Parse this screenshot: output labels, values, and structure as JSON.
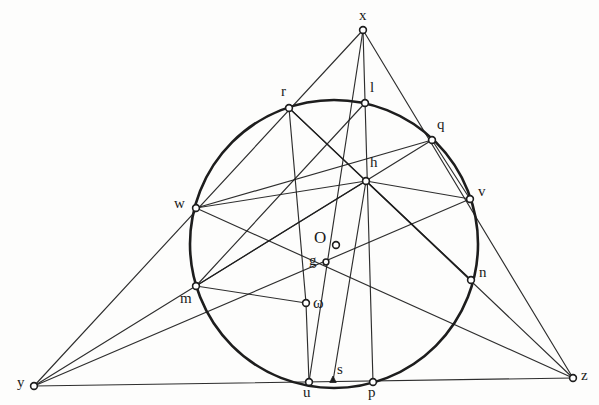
{
  "figure": {
    "background_color": "#fdfdfc",
    "ink_color": "#1d1d1d",
    "circle": {
      "name": "main-circle",
      "center_label": "O",
      "cx": 334,
      "cy": 244,
      "r": 144,
      "stroke_width": 2.6
    },
    "points": [
      {
        "id": "x",
        "label": "x",
        "cx": 363,
        "cy": 30,
        "lx": 359,
        "ly": 8,
        "marker": "ring",
        "size": "normal"
      },
      {
        "id": "y",
        "label": "y",
        "cx": 34,
        "cy": 386,
        "lx": 17,
        "ly": 375,
        "marker": "ring",
        "size": "normal"
      },
      {
        "id": "z",
        "label": "z",
        "cx": 573,
        "cy": 378,
        "lx": 581,
        "ly": 368,
        "marker": "ring",
        "size": "normal"
      },
      {
        "id": "r",
        "label": "r",
        "cx": 289,
        "cy": 108,
        "lx": 281,
        "ly": 84,
        "marker": "ring",
        "size": "normal"
      },
      {
        "id": "l",
        "label": "l",
        "cx": 365,
        "cy": 103,
        "lx": 370,
        "ly": 80,
        "marker": "ring",
        "size": "normal"
      },
      {
        "id": "q",
        "label": "q",
        "cx": 432,
        "cy": 140,
        "lx": 437,
        "ly": 117,
        "marker": "ring",
        "size": "normal"
      },
      {
        "id": "v",
        "label": "v",
        "cx": 470,
        "cy": 199,
        "lx": 478,
        "ly": 184,
        "marker": "ring",
        "size": "normal"
      },
      {
        "id": "n",
        "label": "n",
        "cx": 471,
        "cy": 280,
        "lx": 479,
        "ly": 265,
        "marker": "ring",
        "size": "normal"
      },
      {
        "id": "w",
        "label": "w",
        "cx": 196,
        "cy": 208,
        "lx": 174,
        "ly": 196,
        "marker": "ring",
        "size": "normal"
      },
      {
        "id": "m",
        "label": "m",
        "cx": 196,
        "cy": 286,
        "lx": 180,
        "ly": 291,
        "marker": "ring",
        "size": "normal"
      },
      {
        "id": "h",
        "label": "h",
        "cx": 366,
        "cy": 181,
        "lx": 370,
        "ly": 155,
        "marker": "ring",
        "size": "normal"
      },
      {
        "id": "O",
        "label": "O",
        "cx": 336,
        "cy": 245,
        "lx": 314,
        "ly": 229,
        "marker": "ring",
        "size": "big"
      },
      {
        "id": "g",
        "label": "g",
        "cx": 326,
        "cy": 262,
        "lx": 309,
        "ly": 253,
        "marker": "dot",
        "size": "normal"
      },
      {
        "id": "omega",
        "label": "ω",
        "cx": 306,
        "cy": 303,
        "lx": 313,
        "ly": 295,
        "marker": "ring",
        "size": "omega"
      },
      {
        "id": "u",
        "label": "u",
        "cx": 309,
        "cy": 382,
        "lx": 303,
        "ly": 385,
        "marker": "ring",
        "size": "normal"
      },
      {
        "id": "s",
        "label": "s",
        "cx": 333,
        "cy": 381,
        "lx": 337,
        "ly": 362,
        "marker": "tick",
        "size": "normal"
      },
      {
        "id": "p",
        "label": "p",
        "cx": 373,
        "cy": 382,
        "lx": 368,
        "ly": 385,
        "marker": "ring",
        "size": "normal"
      }
    ],
    "segments": [
      {
        "name": "side-xy",
        "from": "x",
        "to": "y",
        "weight": "thin"
      },
      {
        "name": "side-xz",
        "from": "x",
        "to": "z",
        "weight": "thin"
      },
      {
        "name": "side-yz",
        "from": "y",
        "to": "z",
        "weight": "thin"
      },
      {
        "name": "cevian-x-u",
        "from": "x",
        "to": "u",
        "weight": "thin"
      },
      {
        "name": "cevian-x-p",
        "from": "x",
        "to": "p",
        "weight": "thin"
      },
      {
        "name": "chord-r-n",
        "from": "r",
        "to": "n",
        "weight": "thin"
      },
      {
        "name": "chord-l-m",
        "from": "l",
        "to": "m",
        "weight": "thin"
      },
      {
        "name": "chord-w-q",
        "from": "w",
        "to": "q",
        "weight": "thin"
      },
      {
        "name": "chord-r-omega",
        "from": "r",
        "to": "omega",
        "weight": "thin"
      },
      {
        "name": "chord-w-h",
        "from": "w",
        "to": "h",
        "weight": "thin"
      },
      {
        "name": "chord-h-v",
        "from": "h",
        "to": "v",
        "weight": "thin"
      },
      {
        "name": "chord-h-n",
        "from": "h",
        "to": "n",
        "weight": "thin"
      },
      {
        "name": "chord-h-m",
        "from": "h",
        "to": "m",
        "weight": "thin"
      },
      {
        "name": "chord-q-v",
        "from": "q",
        "to": "v",
        "weight": "thin"
      },
      {
        "name": "line-h-s",
        "from": "h",
        "to": "s",
        "weight": "thin"
      },
      {
        "name": "line-omega-u",
        "from": "omega",
        "to": "u",
        "weight": "thin"
      },
      {
        "name": "line-omega-m",
        "from": "omega",
        "to": "m",
        "weight": "thin"
      },
      {
        "name": "ray-y-w-q",
        "from": "y",
        "to": "q",
        "weight": "thin"
      },
      {
        "name": "ray-y-m-v",
        "from": "y",
        "to": "v",
        "weight": "thin"
      },
      {
        "name": "ray-z-n-w",
        "from": "z",
        "to": "w",
        "weight": "thin"
      },
      {
        "name": "ray-z-v-r",
        "from": "z",
        "to": "r",
        "weight": "thin"
      }
    ]
  }
}
